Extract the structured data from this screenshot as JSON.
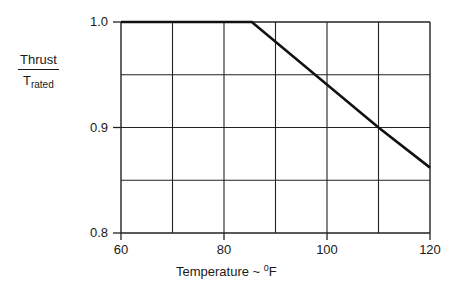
{
  "chart_data": {
    "type": "line",
    "title": "",
    "xlabel": "Temperature ~ °F",
    "xlabel_parts": {
      "text": "Temperature ~ ",
      "degree": "0",
      "unit": "F"
    },
    "ylabel": "Thrust / T_rated",
    "ylabel_parts": {
      "numerator": "Thrust",
      "denominator_main": "T",
      "denominator_sub": "rated"
    },
    "xlim": [
      60,
      120
    ],
    "ylim": [
      0.8,
      1.0
    ],
    "x_ticks": [
      60,
      80,
      100,
      120
    ],
    "x_tick_labels": [
      "60",
      "80",
      "100",
      "120"
    ],
    "y_ticks": [
      0.8,
      0.9,
      1.0
    ],
    "y_tick_labels": [
      "0.8",
      "0.9",
      "1.0"
    ],
    "grid": true,
    "grid_x_step": 10,
    "grid_y_step": 0.05,
    "legend": null,
    "series": [
      {
        "name": "Thrust lapse",
        "x": [
          60,
          85.4,
          110,
          120
        ],
        "y": [
          1.0,
          1.0,
          0.9,
          0.862
        ]
      }
    ]
  }
}
